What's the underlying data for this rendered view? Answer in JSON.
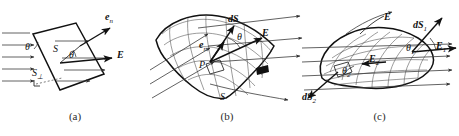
{
  "figure": {
    "background_color": "#ffffff",
    "ink_color": "#111111",
    "width": 459,
    "height": 136
  },
  "panels": [
    {
      "id": "a",
      "caption": "(a)",
      "description": "Flat planar surface in a uniform electric field",
      "labels": {
        "normal_vector": "e",
        "normal_vector_sub": "n",
        "area": "S",
        "area_perp": "S",
        "area_perp_sub": "⊥",
        "angle_at_surface": "θ",
        "angle_at_field": "θ",
        "field": "E"
      }
    },
    {
      "id": "b",
      "caption": "(b)",
      "description": "Curved open surface with area element dS at point P",
      "labels": {
        "area_element": "dS",
        "normal_vector": "e",
        "normal_vector_sub": "n",
        "point": "P",
        "angle": "θ",
        "field": "E",
        "surface": "S"
      }
    },
    {
      "id": "c",
      "caption": "(c)",
      "description": "Closed surface with outgoing and incoming flux elements",
      "labels": {
        "field": "E",
        "element_1": "dS",
        "element_1_sub": "1",
        "element_2": "dS",
        "element_2_sub": "2",
        "angle_1": "θ",
        "angle_1_sub": "1",
        "angle_2": "θ",
        "angle_2_sub": "2",
        "field_1": "E",
        "field_1_sub": "1",
        "field_2": "E",
        "field_2_sub": "2"
      }
    }
  ]
}
